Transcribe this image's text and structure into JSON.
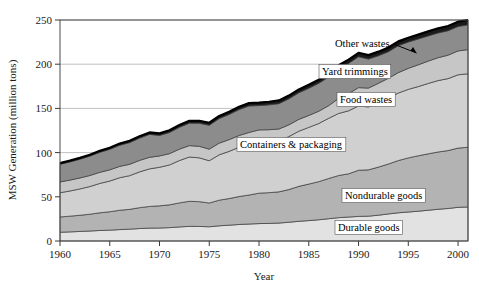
{
  "chart_data": {
    "type": "area",
    "stacked": true,
    "title": "",
    "xlabel": "Year",
    "ylabel": "MSW Generation (million tons)",
    "xlim": [
      1960,
      2001
    ],
    "ylim": [
      0,
      250
    ],
    "yticks": [
      0,
      50,
      100,
      150,
      200,
      250
    ],
    "xticks": [
      1960,
      1965,
      1970,
      1975,
      1980,
      1985,
      1990,
      1995,
      2000
    ],
    "grid": "horizontal",
    "legend": "inline-labels",
    "x": [
      1960,
      1961,
      1962,
      1963,
      1964,
      1965,
      1966,
      1967,
      1968,
      1969,
      1970,
      1971,
      1972,
      1973,
      1974,
      1975,
      1976,
      1977,
      1978,
      1979,
      1980,
      1981,
      1982,
      1983,
      1984,
      1985,
      1986,
      1987,
      1988,
      1989,
      1990,
      1991,
      1992,
      1993,
      1994,
      1995,
      1996,
      1997,
      1998,
      1999,
      2000,
      2001
    ],
    "series": [
      {
        "name": "Durable goods",
        "color": "#e2e2e2",
        "values": [
          9.9,
          10.3,
          10.8,
          11.3,
          11.9,
          12.3,
          12.9,
          13.4,
          14.1,
          14.6,
          14.7,
          15.1,
          15.9,
          16.6,
          16.5,
          16.1,
          17.2,
          17.9,
          18.7,
          19.2,
          19.7,
          19.9,
          20.3,
          21.2,
          22.3,
          23.1,
          24.0,
          25.2,
          26.4,
          27.1,
          27.8,
          28.1,
          29.2,
          30.6,
          31.9,
          32.8,
          33.7,
          34.8,
          35.9,
          36.8,
          38.1,
          38.5
        ]
      },
      {
        "name": "Nondurable goods",
        "color": "#b3b3b3",
        "values": [
          17.3,
          17.8,
          18.3,
          19.0,
          20.0,
          20.8,
          21.9,
          22.4,
          23.6,
          24.5,
          25.1,
          25.8,
          27.2,
          28.3,
          28.0,
          26.9,
          29.0,
          30.1,
          31.6,
          32.8,
          34.4,
          34.8,
          35.3,
          37.0,
          39.5,
          41.3,
          43.1,
          45.5,
          47.7,
          48.9,
          52.2,
          52.4,
          54.4,
          56.5,
          59.1,
          61.2,
          62.7,
          63.8,
          64.8,
          65.5,
          67.0,
          67.5
        ]
      },
      {
        "name": "Containers & packaging",
        "color": "#d0d0d0",
        "values": [
          27.4,
          28.5,
          29.8,
          31.3,
          33.2,
          34.7,
          36.8,
          38.1,
          40.5,
          42.5,
          43.6,
          45.1,
          47.9,
          50.1,
          49.6,
          47.8,
          51.3,
          53.4,
          55.8,
          57.4,
          58.6,
          58.1,
          57.9,
          59.9,
          62.4,
          64.1,
          65.8,
          68.1,
          70.2,
          71.3,
          72.7,
          71.2,
          72.9,
          74.5,
          76.4,
          77.5,
          78.3,
          79.6,
          80.8,
          81.4,
          82.9,
          83.2
        ]
      },
      {
        "name": "Food wastes",
        "color": "#c6c6c6",
        "values": [
          12.2,
          12.3,
          12.4,
          12.5,
          12.6,
          12.7,
          12.8,
          12.9,
          13.0,
          13.1,
          12.8,
          12.8,
          12.9,
          12.9,
          13.0,
          13.1,
          13.2,
          13.3,
          13.3,
          13.4,
          13.0,
          13.1,
          13.2,
          13.3,
          13.4,
          13.5,
          13.9,
          14.3,
          17.0,
          19.5,
          20.8,
          21.3,
          21.9,
          22.5,
          23.1,
          23.8,
          24.6,
          25.3,
          25.9,
          26.5,
          27.0,
          27.3
        ]
      },
      {
        "name": "Yard trimmings",
        "color": "#8c8c8c",
        "values": [
          20.0,
          20.6,
          21.2,
          21.9,
          22.6,
          23.2,
          23.9,
          24.5,
          25.2,
          25.9,
          23.2,
          23.9,
          24.7,
          25.4,
          26.1,
          27.0,
          27.8,
          28.5,
          29.3,
          30.0,
          27.5,
          28.1,
          28.7,
          29.4,
          30.1,
          30.8,
          31.6,
          32.4,
          33.3,
          34.1,
          35.0,
          32.8,
          31.2,
          30.1,
          30.5,
          29.8,
          29.2,
          28.5,
          28.0,
          27.7,
          27.7,
          28.0
        ]
      },
      {
        "name": "Other wastes",
        "color": "#1a1a1a",
        "values": [
          1.3,
          1.4,
          1.5,
          1.6,
          1.7,
          1.8,
          1.9,
          2.0,
          2.1,
          2.2,
          2.4,
          2.5,
          2.6,
          2.7,
          2.8,
          2.9,
          3.0,
          3.1,
          3.2,
          3.3,
          3.4,
          3.5,
          3.6,
          3.7,
          3.8,
          3.9,
          4.0,
          4.1,
          4.2,
          4.3,
          4.4,
          4.5,
          4.6,
          4.7,
          4.8,
          4.9,
          5.0,
          5.1,
          5.2,
          5.3,
          5.4,
          5.5
        ]
      }
    ],
    "annotations": [
      {
        "name": "other-wastes-label",
        "text": "Other wastes",
        "arrow": true
      },
      {
        "name": "yard-trimmings-label",
        "text": "Yard trimmings",
        "arrow": false
      },
      {
        "name": "food-wastes-label",
        "text": "Food wastes",
        "arrow": false
      },
      {
        "name": "containers-packaging-label",
        "text": "Containers & packaging",
        "arrow": false
      },
      {
        "name": "nondurable-goods-label",
        "text": "Nondurable goods",
        "arrow": false
      },
      {
        "name": "durable-goods-label",
        "text": "Durable goods",
        "arrow": false
      }
    ]
  },
  "axes": {
    "y_title": "MSW Generation (million tons)",
    "x_title": "Year",
    "y_tick_labels": [
      "0",
      "50",
      "100",
      "150",
      "200",
      "250"
    ],
    "x_tick_labels": [
      "1960",
      "1965",
      "1970",
      "1975",
      "1980",
      "1985",
      "1990",
      "1995",
      "2000"
    ]
  }
}
